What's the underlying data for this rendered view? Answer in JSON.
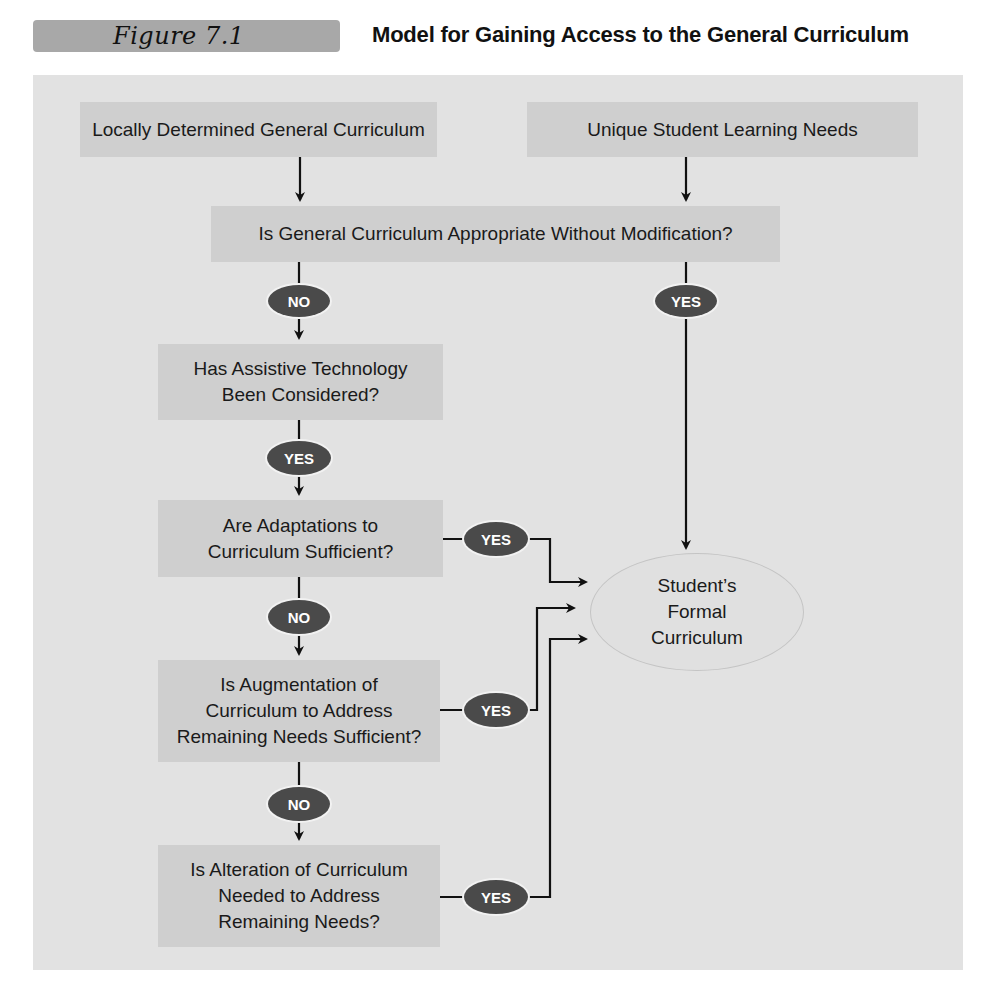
{
  "figure": {
    "label": "Figure 7.1",
    "title": "Model for Gaining Access to the General Curriculum"
  },
  "colors": {
    "panel": "#e2e2e2",
    "box": "#cfcfcf",
    "pill": "#4a4a4a",
    "label_bar": "#a8a8a8",
    "line": "#111111"
  },
  "nodes": {
    "local_curriculum": "Locally Determined General Curriculum",
    "unique_needs": "Unique Student Learning Needs",
    "appropriate_q": "Is General Curriculum Appropriate Without Modification?",
    "assistive_q": [
      "Has Assistive Technology",
      "Been Considered?"
    ],
    "adaptations_q": [
      "Are Adaptations to",
      "Curriculum Sufficient?"
    ],
    "augmentation_q": [
      "Is Augmentation of",
      "Curriculum to Address",
      "Remaining Needs Sufficient?"
    ],
    "alteration_q": [
      "Is Alteration of Curriculum",
      "Needed to Address",
      "Remaining Needs?"
    ],
    "formal_curriculum": [
      "Student’s",
      "Formal",
      "Curriculum"
    ]
  },
  "decisions": {
    "appropriate_no": "NO",
    "appropriate_yes": "YES",
    "assistive_yes": "YES",
    "adaptations_yes": "YES",
    "adaptations_no": "NO",
    "augmentation_yes": "YES",
    "augmentation_no": "NO",
    "alteration_yes": "YES"
  }
}
